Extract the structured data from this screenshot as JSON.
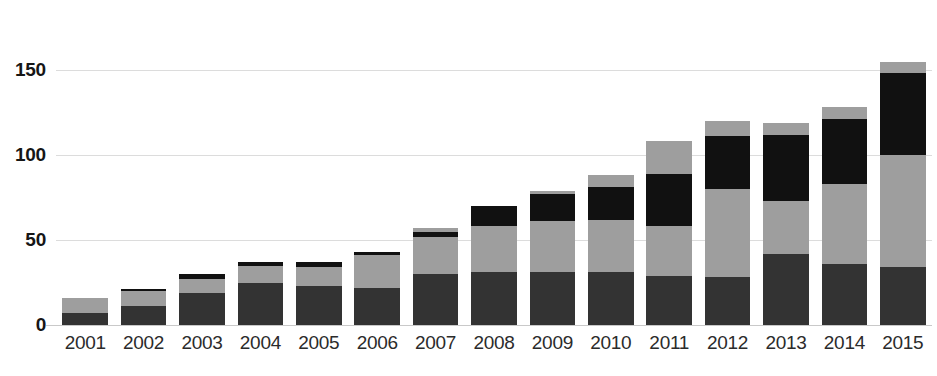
{
  "chart_data": {
    "type": "bar",
    "stacked": true,
    "title": "",
    "subtitle": "",
    "xlabel": "",
    "ylabel": "",
    "ylim": [
      0,
      160
    ],
    "yticks": [
      0,
      50,
      100,
      150
    ],
    "ytick_labels": [
      "0",
      "50",
      "100",
      "150"
    ],
    "grid": true,
    "grid_axis": "y",
    "legend": false,
    "legend_position": "none",
    "categories": [
      "2001",
      "2002",
      "2003",
      "2004",
      "2005",
      "2006",
      "2007",
      "2008",
      "2009",
      "2010",
      "2011",
      "2012",
      "2013",
      "2014",
      "2015"
    ],
    "series": [
      {
        "name": "series-1",
        "color": "#333333",
        "values": [
          7,
          11,
          19,
          25,
          23,
          22,
          30,
          31,
          31,
          31,
          29,
          28,
          42,
          36,
          34
        ]
      },
      {
        "name": "series-2",
        "color": "#9e9e9e",
        "values": [
          9,
          9,
          8,
          10,
          11,
          19,
          22,
          27,
          30,
          31,
          29,
          52,
          31,
          47,
          66
        ]
      },
      {
        "name": "series-3",
        "color": "#111111",
        "values": [
          0,
          1,
          3,
          2,
          3,
          2,
          3,
          12,
          16,
          19,
          31,
          31,
          39,
          38,
          48
        ]
      },
      {
        "name": "series-4",
        "color": "#9e9e9e",
        "values": [
          0,
          0,
          0,
          0,
          0,
          0,
          2,
          0,
          2,
          7,
          19,
          9,
          7,
          7,
          7
        ]
      }
    ],
    "totals": [
      16,
      21,
      30,
      37,
      37,
      43,
      57,
      70,
      79,
      88,
      108,
      120,
      119,
      128,
      155
    ],
    "colors": {
      "dark_gray": "#333333",
      "mid_gray": "#9e9e9e",
      "black": "#111111",
      "gridline": "#dcdcdc",
      "axis": "#c9c9c9",
      "tick_text": "#161616",
      "background": "#ffffff"
    }
  }
}
